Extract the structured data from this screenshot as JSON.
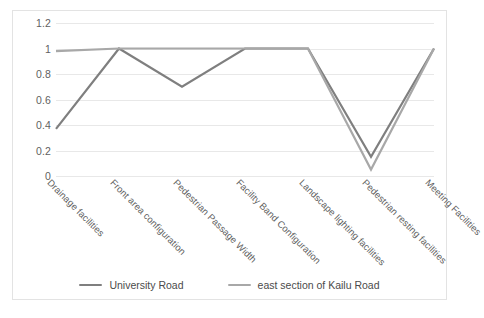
{
  "chart_data": {
    "type": "line",
    "title": "",
    "xlabel": "",
    "ylabel": "",
    "ylim": [
      0,
      1.2
    ],
    "yticks": [
      0,
      0.2,
      0.4,
      0.6,
      0.8,
      1,
      1.2
    ],
    "ytick_labels": [
      "0",
      "0.2",
      "0.4",
      "0.6",
      "0.8",
      "1",
      "1.2"
    ],
    "grid": "horizontal",
    "legend_position": "bottom-center",
    "categories": [
      "Drainage facilities",
      "Front area configuration",
      "Pedestrian Passage Width",
      "Facility Band Configuration",
      "Landscape lighting facilities",
      "Pedestrian resting facilities",
      "Meeting Facilities"
    ],
    "series": [
      {
        "name": "University Road",
        "color": "#7f7f7f",
        "values": [
          0.37,
          1.0,
          0.7,
          1.0,
          1.0,
          0.15,
          1.0
        ]
      },
      {
        "name": "east section of Kailu Road",
        "color": "#a8a8a8",
        "values": [
          0.98,
          1.0,
          1.0,
          1.0,
          1.0,
          0.05,
          1.0
        ]
      }
    ]
  },
  "legend": {
    "items": [
      {
        "label": "University Road",
        "color": "#7f7f7f"
      },
      {
        "label": "east section of Kailu Road",
        "color": "#a8a8a8"
      }
    ]
  },
  "frame": {
    "border_color": "#e3e3e3",
    "grid_color": "#e8e8e8",
    "background": "#ffffff"
  }
}
